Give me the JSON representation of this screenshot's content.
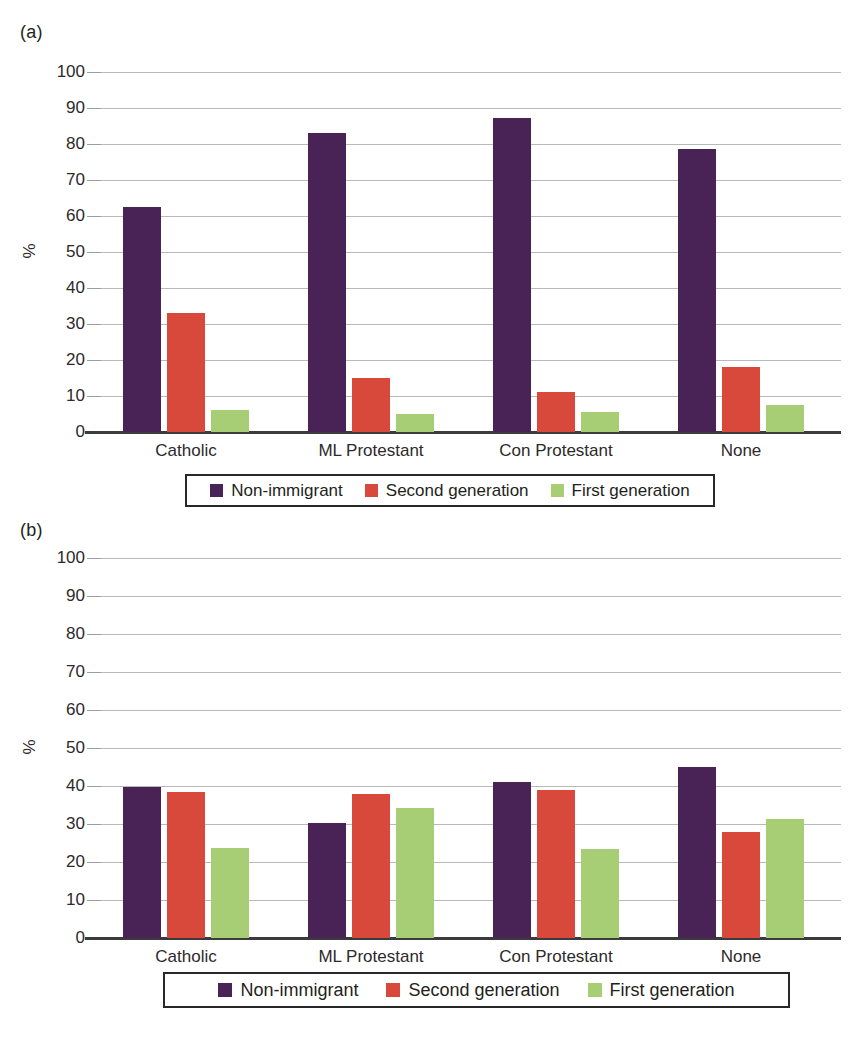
{
  "figure": {
    "panel_a_letter": "(a)",
    "panel_b_letter": "(b)"
  },
  "chart_data": [
    {
      "type": "bar",
      "panel": "(a)",
      "title": "",
      "xlabel": "",
      "ylabel": "%",
      "ylim": [
        0,
        100
      ],
      "yticks": [
        0,
        10,
        20,
        30,
        40,
        50,
        60,
        70,
        80,
        90,
        100
      ],
      "ytick_labels": [
        "0",
        "10",
        "20",
        "30",
        "40",
        "50",
        "60",
        "70",
        "80",
        "90",
        "100"
      ],
      "grid": true,
      "legend_position": "below",
      "categories": [
        "Catholic",
        "ML Protestant",
        "Con Protestant",
        "None"
      ],
      "series": [
        {
          "name": "Non-immigrant",
          "color": "#4a2356",
          "values": [
            62.5,
            83.0,
            87.2,
            78.6
          ]
        },
        {
          "name": "Second generation",
          "color": "#d9493b",
          "values": [
            33.0,
            15.0,
            11.0,
            18.0
          ]
        },
        {
          "name": "First generation",
          "color": "#a7ce74",
          "values": [
            6.0,
            5.0,
            5.5,
            7.5
          ]
        }
      ]
    },
    {
      "type": "bar",
      "panel": "(b)",
      "title": "",
      "xlabel": "",
      "ylabel": "%",
      "ylim": [
        0,
        100
      ],
      "yticks": [
        0,
        10,
        20,
        30,
        40,
        50,
        60,
        70,
        80,
        90,
        100
      ],
      "ytick_labels": [
        "0",
        "10",
        "20",
        "30",
        "40",
        "50",
        "60",
        "70",
        "80",
        "90",
        "100"
      ],
      "grid": true,
      "legend_position": "below",
      "categories": [
        "Catholic",
        "ML Protestant",
        "Con Protestant",
        "None"
      ],
      "series": [
        {
          "name": "Non-immigrant",
          "color": "#4a2356",
          "values": [
            39.8,
            30.2,
            41.0,
            45.0
          ]
        },
        {
          "name": "Second generation",
          "color": "#d9493b",
          "values": [
            38.3,
            37.8,
            39.0,
            28.0
          ]
        },
        {
          "name": "First generation",
          "color": "#a7ce74",
          "values": [
            23.7,
            34.3,
            23.4,
            31.2
          ]
        }
      ]
    }
  ],
  "legend_a": {
    "items": [
      {
        "label": "Non-immigrant",
        "color": "#4a2356"
      },
      {
        "label": "Second generation",
        "color": "#d9493b"
      },
      {
        "label": "First generation",
        "color": "#a7ce74"
      }
    ]
  },
  "legend_b": {
    "items": [
      {
        "label": "Non-immigrant",
        "color": "#4a2356"
      },
      {
        "label": "Second generation",
        "color": "#d9493b"
      },
      {
        "label": "First generation",
        "color": "#a7ce74"
      }
    ]
  }
}
